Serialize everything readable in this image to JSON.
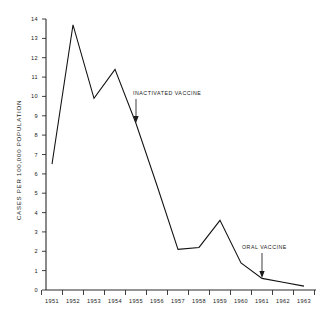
{
  "chart_data": {
    "type": "line",
    "title": "",
    "xlabel": "",
    "ylabel": "CASES PER 100,000 POPULATION",
    "x": [
      "1951",
      "1952",
      "1953",
      "1954",
      "1955",
      "1956",
      "1957",
      "1958",
      "1959",
      "1960",
      "1961",
      "1962",
      "1963"
    ],
    "values": [
      6.5,
      13.7,
      9.9,
      11.4,
      8.6,
      5.4,
      2.1,
      2.2,
      3.6,
      1.4,
      0.6,
      0.4,
      0.2
    ],
    "series": [
      {
        "name": "Poliomyelitis incidence",
        "values": [
          6.5,
          13.7,
          9.9,
          11.4,
          8.6,
          5.4,
          2.1,
          2.2,
          3.6,
          1.4,
          0.6,
          0.4,
          0.2
        ]
      }
    ],
    "ylim": [
      0,
      14
    ],
    "xlim": [
      "1951",
      "1963"
    ],
    "y_ticks": [
      "0",
      "1",
      "2",
      "3",
      "4",
      "5",
      "6",
      "7",
      "8",
      "9",
      "10",
      "11",
      "12",
      "13",
      "14"
    ],
    "x_ticks": [
      "1951",
      "1952",
      "1953",
      "1954",
      "1955",
      "1956",
      "1957",
      "1958",
      "1959",
      "1960",
      "1961",
      "1962",
      "1963"
    ],
    "grid": false,
    "legend": "none",
    "annotations": [
      {
        "label": "INACTIVATED VACCINE",
        "points_to_x": "1955",
        "points_to_y": 8.6
      },
      {
        "label": "ORAL VACCINE",
        "points_to_x": "1961",
        "points_to_y": 0.6
      }
    ],
    "colors": {
      "line": "#111111",
      "axis": "#2a2a2a",
      "background": "#ffffff",
      "text": "#1a1a1a"
    }
  }
}
